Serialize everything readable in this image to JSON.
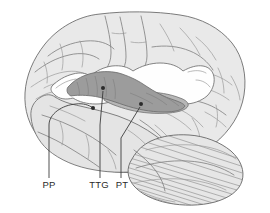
{
  "figure": {
    "type": "anatomical-diagram",
    "background_color": "#ffffff"
  },
  "colors": {
    "cortex": "#e9e9e9",
    "cortex_outline": "#6d6d6d",
    "sulcus_line": "#7d7d7d",
    "opened_fissure_white": "#fefefe",
    "supratemporal_plane_dark": "#9c9c9c",
    "supratemporal_plane_mid": "#b6b6b6",
    "cerebellum": "#e6e6e6",
    "leader_line": "#333333",
    "label_text": "#2a2a2a"
  },
  "labels": [
    {
      "id": "pp",
      "text": "PP",
      "meaning": "planum polare",
      "x": 49,
      "y": 186,
      "leader": {
        "style": "curved",
        "dot_x": 93,
        "dot_y": 108
      }
    },
    {
      "id": "ttg",
      "text": "TTG",
      "meaning": "transverse temporal gyrus",
      "x": 97,
      "y": 186,
      "leader": {
        "style": "straight-vertical",
        "dot_x": 103,
        "dot_y": 88
      }
    },
    {
      "id": "pt",
      "text": "PT",
      "meaning": "planum temporale",
      "x": 120,
      "y": 186,
      "leader": {
        "style": "straight-diagonal",
        "dot_x": 141,
        "dot_y": 104
      }
    }
  ],
  "regions": [
    {
      "id": "cerebrum",
      "name": "cerebral hemisphere"
    },
    {
      "id": "frontal-operculum",
      "name": "frontal operculum"
    },
    {
      "id": "supratemporal-plane",
      "name": "supratemporal plane"
    },
    {
      "id": "temporal-lobe",
      "name": "temporal lobe"
    },
    {
      "id": "cerebellum",
      "name": "cerebellum"
    }
  ]
}
